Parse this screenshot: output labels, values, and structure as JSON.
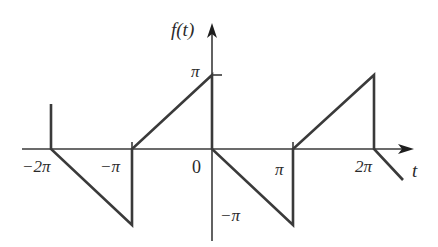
{
  "figure": {
    "y_axis_label": "f(t)",
    "x_axis_label": "t",
    "x_ticks": [
      {
        "label": "−2π",
        "value": -6.2832
      },
      {
        "label": "−π",
        "value": -3.1416
      },
      {
        "label": "0",
        "value": 0
      },
      {
        "label": "π",
        "value": 3.1416
      },
      {
        "label": "2π",
        "value": 6.2832
      }
    ],
    "y_ticks": [
      {
        "label": "π",
        "value": 3.1416
      },
      {
        "label": "−π",
        "value": -3.1416
      }
    ],
    "labels": {
      "ylabel": "f(t)",
      "xlabel": "t",
      "tick_m2pi": "−2π",
      "tick_mpi": "−π",
      "tick_0": "0",
      "tick_pi": "π",
      "tick_2pi": "2π",
      "ytick_pi": "π",
      "ytick_mpi": "−π"
    },
    "segments": [
      {
        "from": [
          -6.2832,
          1.8
        ],
        "to": [
          -6.2832,
          0
        ]
      },
      {
        "from": [
          -6.2832,
          0
        ],
        "to": [
          -3.1416,
          -3.1416
        ]
      },
      {
        "from": [
          -3.1416,
          -3.1416
        ],
        "to": [
          -3.1416,
          0
        ]
      },
      {
        "from": [
          -3.1416,
          0
        ],
        "to": [
          0,
          3.1416
        ]
      },
      {
        "from": [
          0,
          3.1416
        ],
        "to": [
          0,
          0
        ]
      },
      {
        "from": [
          0,
          0
        ],
        "to": [
          3.1416,
          -3.1416
        ]
      },
      {
        "from": [
          3.1416,
          -3.1416
        ],
        "to": [
          3.1416,
          0
        ]
      },
      {
        "from": [
          3.1416,
          0
        ],
        "to": [
          6.2832,
          3.1416
        ]
      },
      {
        "from": [
          6.2832,
          3.1416
        ],
        "to": [
          6.2832,
          0
        ]
      },
      {
        "from": [
          6.2832,
          0
        ],
        "to": [
          7.4,
          -1.2
        ]
      }
    ],
    "colors": {
      "line": "#3a3a3a",
      "text": "#2a2a2a",
      "background": "#ffffff"
    }
  }
}
